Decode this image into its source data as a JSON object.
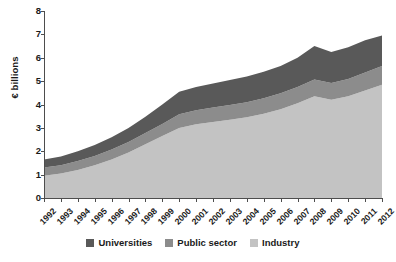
{
  "chart_data": {
    "type": "area",
    "stacked": true,
    "title": "",
    "xlabel": "",
    "ylabel": "€ billions",
    "ylim": [
      0,
      8
    ],
    "ytick_step": 1,
    "yticks": [
      "8",
      "7",
      "6",
      "5",
      "4",
      "3",
      "2",
      "1",
      "0"
    ],
    "grid": false,
    "legend_position": "bottom-center",
    "x": [
      "1992",
      "1993",
      "1994",
      "1995",
      "1996",
      "1997",
      "1998",
      "1999",
      "2000",
      "2001",
      "2002",
      "2003",
      "2004",
      "2005",
      "2006",
      "2007",
      "2008",
      "2009",
      "2010",
      "2011",
      "2012"
    ],
    "categories": [
      "1992",
      "1993",
      "1994",
      "1995",
      "1996",
      "1997",
      "1998",
      "1999",
      "2000",
      "2001",
      "2002",
      "2003",
      "2004",
      "2005",
      "2006",
      "2007",
      "2008",
      "2009",
      "2010",
      "2011",
      "2012"
    ],
    "series": [
      {
        "name": "Industry",
        "color": "#c3c3c3",
        "values": [
          0.95,
          1.05,
          1.2,
          1.4,
          1.65,
          1.95,
          2.3,
          2.65,
          3.0,
          3.15,
          3.25,
          3.35,
          3.45,
          3.6,
          3.8,
          4.05,
          4.35,
          4.2,
          4.35,
          4.6,
          4.85
        ]
      },
      {
        "name": "Public sector",
        "color": "#8c8c8c",
        "values": [
          0.35,
          0.35,
          0.38,
          0.4,
          0.42,
          0.45,
          0.48,
          0.52,
          0.58,
          0.6,
          0.62,
          0.63,
          0.65,
          0.67,
          0.68,
          0.7,
          0.72,
          0.72,
          0.74,
          0.77,
          0.8
        ]
      },
      {
        "name": "Universities",
        "color": "#595959",
        "values": [
          0.35,
          0.38,
          0.42,
          0.47,
          0.53,
          0.6,
          0.7,
          0.83,
          0.97,
          1.0,
          1.03,
          1.07,
          1.1,
          1.13,
          1.17,
          1.25,
          1.43,
          1.33,
          1.36,
          1.38,
          1.3
        ]
      }
    ],
    "totals": [
      1.65,
      1.78,
      2.0,
      2.27,
      2.6,
      3.0,
      3.48,
      4.0,
      4.55,
      4.75,
      4.9,
      5.05,
      5.2,
      5.4,
      5.65,
      6.0,
      6.5,
      6.25,
      6.45,
      6.75,
      6.95
    ]
  },
  "legend": {
    "items": [
      {
        "label": "Universities",
        "color": "#595959"
      },
      {
        "label": "Public sector",
        "color": "#8c8c8c"
      },
      {
        "label": "Industry",
        "color": "#c3c3c3"
      }
    ]
  }
}
